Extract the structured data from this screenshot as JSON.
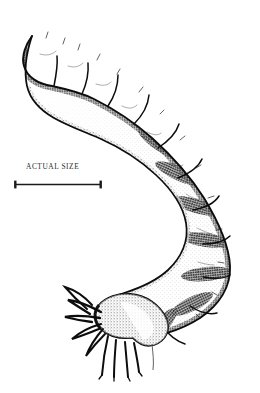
{
  "figure": {
    "subject_name": "insect-larva",
    "medium": "stippled pen-and-ink scientific illustration",
    "ink_color": "#101010",
    "background_color": "#ffffff",
    "orientation": "C-curved body, tail at upper left, head at lower center",
    "segment_count": 11
  },
  "scale": {
    "caption": "ACTUAL SIZE",
    "bar_left_x": 14,
    "bar_right_x": 102,
    "bar_y": 183,
    "bar_length_px": 88,
    "tick_height_px": 9,
    "caption_color": "#2b2b2b",
    "bar_color": "#1a1a1a"
  }
}
